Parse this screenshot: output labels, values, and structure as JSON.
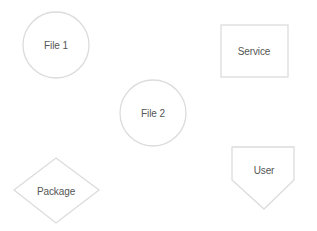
{
  "diagram": {
    "background": "#ffffff",
    "stroke_color": "#dcdcdc",
    "text_color": "#555555",
    "nodes": [
      {
        "id": "file1",
        "label": "File 1",
        "shape": "circle",
        "cx": 56,
        "cy": 45,
        "r": 33
      },
      {
        "id": "service",
        "label": "Service",
        "shape": "rectangle",
        "x": 221,
        "y": 25,
        "w": 67,
        "h": 52
      },
      {
        "id": "file2",
        "label": "File 2",
        "shape": "circle",
        "cx": 153,
        "cy": 113,
        "r": 33
      },
      {
        "id": "package",
        "label": "Package",
        "shape": "diamond",
        "cx": 56,
        "cy": 190,
        "w": 85,
        "h": 65
      },
      {
        "id": "user",
        "label": "User",
        "shape": "pentagon-down",
        "x": 232,
        "y": 147,
        "w": 62,
        "h": 62
      }
    ],
    "edges": []
  }
}
